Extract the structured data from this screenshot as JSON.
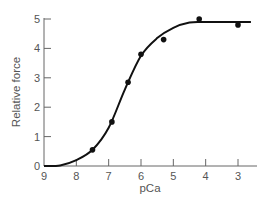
{
  "chart_data": {
    "type": "scatter",
    "title": "",
    "xlabel": "pCa",
    "ylabel": "Relative force",
    "xlim": [
      9,
      2.6
    ],
    "ylim": [
      0,
      5
    ],
    "x_reversed": true,
    "grid": false,
    "legend": null,
    "x_ticks": [
      "9",
      "8",
      "7",
      "6",
      "5",
      "4",
      "3"
    ],
    "y_ticks": [
      "0",
      "1",
      "2",
      "3",
      "4",
      "5"
    ],
    "series": [
      {
        "name": "measured",
        "kind": "scatter",
        "points": [
          {
            "x": 7.5,
            "y": 0.55
          },
          {
            "x": 6.9,
            "y": 1.5
          },
          {
            "x": 6.4,
            "y": 2.85
          },
          {
            "x": 6.0,
            "y": 3.8
          },
          {
            "x": 5.3,
            "y": 4.3
          },
          {
            "x": 4.2,
            "y": 5.0
          },
          {
            "x": 3.0,
            "y": 4.8
          }
        ]
      },
      {
        "name": "fitted curve",
        "kind": "line",
        "shape": "sigmoid",
        "points": [
          {
            "x": 9.0,
            "y": 0.0
          },
          {
            "x": 8.5,
            "y": 0.02
          },
          {
            "x": 8.0,
            "y": 0.2
          },
          {
            "x": 7.5,
            "y": 0.55
          },
          {
            "x": 7.0,
            "y": 1.3
          },
          {
            "x": 6.5,
            "y": 2.6
          },
          {
            "x": 6.0,
            "y": 3.75
          },
          {
            "x": 5.5,
            "y": 4.35
          },
          {
            "x": 5.0,
            "y": 4.7
          },
          {
            "x": 4.5,
            "y": 4.88
          },
          {
            "x": 4.0,
            "y": 4.9
          },
          {
            "x": 2.6,
            "y": 4.9
          }
        ]
      }
    ]
  }
}
